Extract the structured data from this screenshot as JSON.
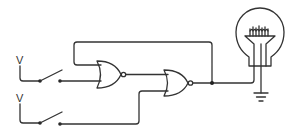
{
  "diagram": {
    "type": "logic-circuit",
    "colors": {
      "stroke": "#333333",
      "background": "#ffffff"
    },
    "sources": [
      {
        "id": "source-top",
        "label": "V"
      },
      {
        "id": "source-bottom",
        "label": "V"
      }
    ],
    "switches": [
      {
        "id": "switch-top",
        "state": "open"
      },
      {
        "id": "switch-bottom",
        "state": "open"
      }
    ],
    "gates": [
      {
        "id": "gate-1",
        "type": "NOR",
        "inputs": [
          "switch-top",
          "feedback-from-gate-2"
        ]
      },
      {
        "id": "gate-2",
        "type": "NOR",
        "inputs": [
          "gate-1",
          "switch-bottom"
        ]
      }
    ],
    "output": {
      "id": "bulb",
      "type": "light-bulb",
      "grounded": true
    }
  }
}
